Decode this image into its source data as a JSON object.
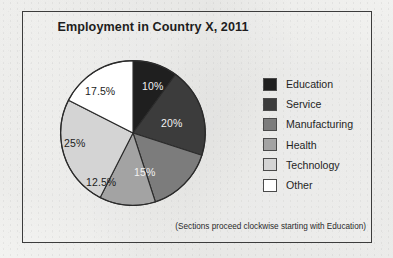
{
  "chart_data": {
    "type": "pie",
    "title": "Employment in Country X, 2011",
    "footnote": "(Sections proceed clockwise starting with Education)",
    "categories": [
      "Education",
      "Service",
      "Manufacturing",
      "Health",
      "Technology",
      "Other"
    ],
    "values": [
      10,
      20,
      15,
      12.5,
      25,
      17.5
    ],
    "value_labels": [
      "10%",
      "20%",
      "15%",
      "12.5%",
      "25%",
      "17.5%"
    ],
    "colors": [
      "#1f1f1f",
      "#3c3c3c",
      "#7c7c7c",
      "#a3a3a3",
      "#d4d4d4",
      "#ffffff"
    ],
    "label_text_on_dark": [
      true,
      true,
      true,
      false,
      false,
      false
    ],
    "start_angle_deg": 0,
    "direction": "clockwise",
    "legend_position": "right",
    "grid": false,
    "xlabel": "",
    "ylabel": ""
  },
  "frame": {
    "border_color": "#3c3c3c"
  },
  "legend": {
    "items": [
      {
        "label": "Education",
        "color": "#1f1f1f"
      },
      {
        "label": "Service",
        "color": "#3c3c3c"
      },
      {
        "label": "Manufacturing",
        "color": "#7c7c7c"
      },
      {
        "label": "Health",
        "color": "#a3a3a3"
      },
      {
        "label": "Technology",
        "color": "#d4d4d4"
      },
      {
        "label": "Other",
        "color": "#ffffff"
      }
    ]
  },
  "slice_labels": [
    {
      "text": "10%",
      "left": 82,
      "top": 20,
      "tone": "on-dark"
    },
    {
      "text": "20%",
      "left": 101,
      "top": 57,
      "tone": "on-dark"
    },
    {
      "text": "15%",
      "left": 74,
      "top": 106,
      "tone": "on-dark"
    },
    {
      "text": "12.5%",
      "left": 26,
      "top": 116,
      "tone": "on-light"
    },
    {
      "text": "25%",
      "left": 4,
      "top": 77,
      "tone": "on-light"
    },
    {
      "text": "17.5%",
      "left": 25,
      "top": 25,
      "tone": "on-light"
    }
  ]
}
